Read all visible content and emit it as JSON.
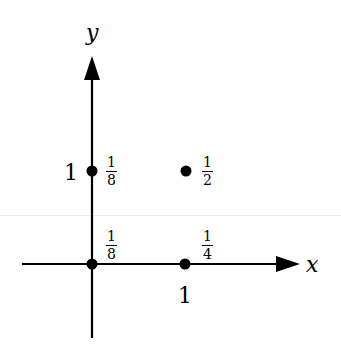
{
  "diagram": {
    "axes": {
      "x_label": "x",
      "y_label": "y",
      "x_tick_label": "1",
      "y_tick_label": "1"
    },
    "points": [
      {
        "id": "origin",
        "coords": [
          0,
          0
        ],
        "label_num": "1",
        "label_den": "8"
      },
      {
        "id": "x1",
        "coords": [
          1,
          0
        ],
        "label_num": "1",
        "label_den": "4"
      },
      {
        "id": "y1",
        "coords": [
          0,
          1
        ],
        "label_num": "1",
        "label_den": "8"
      },
      {
        "id": "xy1",
        "coords": [
          1,
          1
        ],
        "label_num": "1",
        "label_den": "2"
      }
    ],
    "colors": {
      "ink": "#000000",
      "background": "#ffffff"
    }
  }
}
